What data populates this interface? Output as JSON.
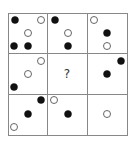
{
  "puzzle": {
    "type": "3x3 dot matrix pattern puzzle",
    "grid": {
      "x0": 8,
      "y0": 13,
      "x1": 127,
      "y1": 135,
      "col_lines": [
        47,
        87
      ],
      "row_lines": [
        53,
        94
      ]
    },
    "line_color": "#888888",
    "filled_color": "#111111",
    "open_stroke": "#555555",
    "radius": 3.5,
    "missing_label": "?",
    "missing_position": {
      "x": 67,
      "y": 74
    },
    "cells": [
      {
        "row": 0,
        "col": 0,
        "dots": [
          {
            "x": 15,
            "y": 20,
            "filled": true
          },
          {
            "x": 41,
            "y": 20,
            "filled": false
          },
          {
            "x": 28,
            "y": 33,
            "filled": false
          },
          {
            "x": 14,
            "y": 46,
            "filled": true
          },
          {
            "x": 28,
            "y": 46,
            "filled": true
          }
        ]
      },
      {
        "row": 0,
        "col": 1,
        "dots": [
          {
            "x": 55,
            "y": 20,
            "filled": true
          },
          {
            "x": 68,
            "y": 33,
            "filled": false
          },
          {
            "x": 68,
            "y": 46,
            "filled": true
          }
        ]
      },
      {
        "row": 0,
        "col": 2,
        "dots": [
          {
            "x": 94,
            "y": 20,
            "filled": false
          },
          {
            "x": 107,
            "y": 33,
            "filled": true
          },
          {
            "x": 107,
            "y": 46,
            "filled": false
          }
        ]
      },
      {
        "row": 1,
        "col": 0,
        "dots": [
          {
            "x": 41,
            "y": 61,
            "filled": false
          },
          {
            "x": 28,
            "y": 74,
            "filled": false
          },
          {
            "x": 14,
            "y": 87,
            "filled": true
          }
        ]
      },
      {
        "row": 1,
        "col": 1,
        "dots": [],
        "missing": true
      },
      {
        "row": 1,
        "col": 2,
        "dots": [
          {
            "x": 121,
            "y": 61,
            "filled": true
          },
          {
            "x": 107,
            "y": 74,
            "filled": true
          }
        ]
      },
      {
        "row": 2,
        "col": 0,
        "dots": [
          {
            "x": 41,
            "y": 100,
            "filled": true
          },
          {
            "x": 28,
            "y": 114,
            "filled": true
          },
          {
            "x": 14,
            "y": 127,
            "filled": false
          }
        ]
      },
      {
        "row": 2,
        "col": 1,
        "dots": [
          {
            "x": 54,
            "y": 100,
            "filled": false
          },
          {
            "x": 68,
            "y": 114,
            "filled": true
          }
        ]
      },
      {
        "row": 2,
        "col": 2,
        "dots": [
          {
            "x": 107,
            "y": 114,
            "filled": false
          }
        ]
      }
    ]
  }
}
